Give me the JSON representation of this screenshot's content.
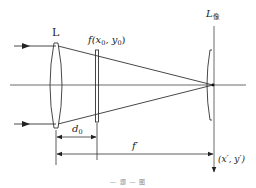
{
  "diagram": {
    "type": "optical-setup",
    "labels": {
      "lens": "L",
      "filter_name": "f",
      "filter_args": "(x",
      "filter_sub0": "0",
      "filter_mid": ", y",
      "filter_sub1": "0",
      "filter_end": ")",
      "image_lens": "L",
      "image_lens_sub": "像",
      "distance_d": "d",
      "distance_d_sub": "0",
      "focal": "f′",
      "image_coords": "(x′, y′)"
    },
    "caption": "— 题 — 图",
    "colors": {
      "line": "#333333",
      "background": "#ffffff"
    }
  }
}
